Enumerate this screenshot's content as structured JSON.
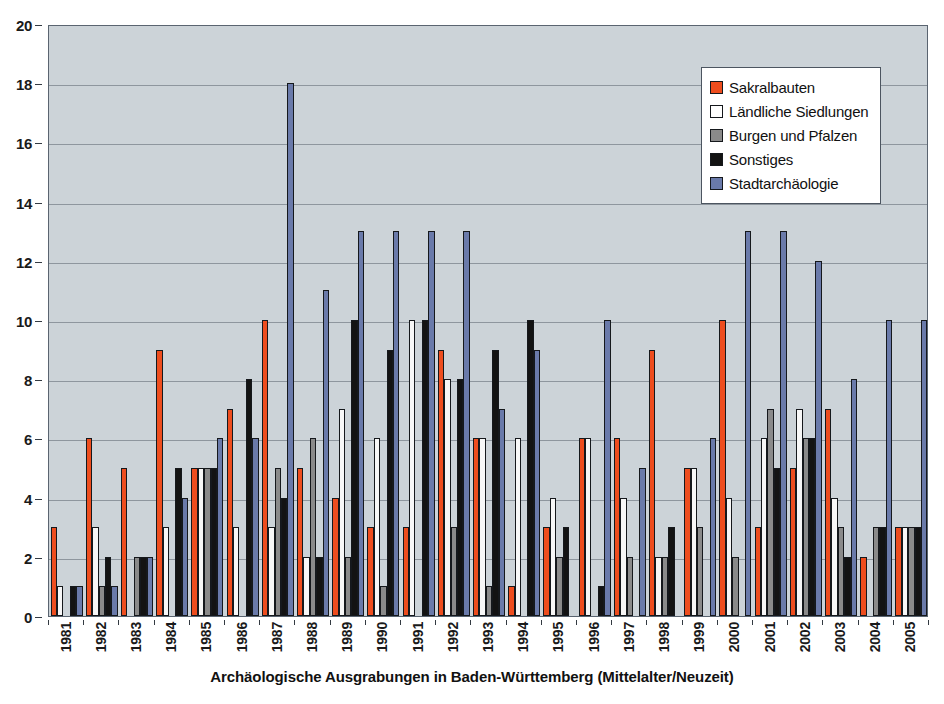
{
  "chart_data": {
    "type": "bar",
    "title": "Archäologische Ausgrabungen in Baden-Württemberg (Mittelalter/Neuzeit)",
    "xlabel": "Archäologische Ausgrabungen in Baden-Württemberg (Mittelalter/Neuzeit)",
    "ylabel": "",
    "ylim": [
      0,
      20
    ],
    "ytick_step": 2,
    "yticks": [
      0,
      2,
      4,
      6,
      8,
      10,
      12,
      14,
      16,
      18,
      20
    ],
    "grid": true,
    "legend_position": "top-right",
    "categories": [
      "1981",
      "1982",
      "1983",
      "1984",
      "1985",
      "1986",
      "1987",
      "1988",
      "1989",
      "1990",
      "1991",
      "1992",
      "1993",
      "1994",
      "1995",
      "1996",
      "1997",
      "1998",
      "1999",
      "2000",
      "2001",
      "2002",
      "2003",
      "2004",
      "2005"
    ],
    "series": [
      {
        "name": "Sakralbauten",
        "color": "#ee4d1e",
        "values": [
          3,
          6,
          5,
          9,
          5,
          7,
          10,
          5,
          4,
          3,
          3,
          9,
          6,
          1,
          3,
          6,
          6,
          9,
          5,
          10,
          3,
          5,
          7,
          2,
          3
        ]
      },
      {
        "name": "Ländliche Siedlungen",
        "color": "#f7f7f7",
        "values": [
          1,
          3,
          0,
          3,
          5,
          3,
          3,
          2,
          7,
          6,
          10,
          8,
          6,
          6,
          4,
          6,
          4,
          2,
          5,
          4,
          6,
          7,
          4,
          0,
          3
        ]
      },
      {
        "name": "Burgen und Pfalzen",
        "color": "#8a8a8a",
        "values": [
          0,
          1,
          2,
          0,
          5,
          0,
          5,
          6,
          2,
          1,
          0,
          3,
          1,
          0,
          2,
          0,
          2,
          2,
          3,
          2,
          7,
          6,
          3,
          3,
          3
        ]
      },
      {
        "name": "Sonstiges",
        "color": "#131313",
        "values": [
          1,
          2,
          2,
          5,
          5,
          8,
          4,
          2,
          10,
          9,
          10,
          8,
          9,
          10,
          3,
          1,
          0,
          3,
          0,
          0,
          5,
          6,
          2,
          3,
          3
        ]
      },
      {
        "name": "Stadtarchäologie",
        "color": "#6a7aaa",
        "values": [
          1,
          1,
          2,
          4,
          6,
          6,
          18,
          11,
          13,
          13,
          13,
          13,
          7,
          9,
          0,
          10,
          5,
          0,
          6,
          13,
          13,
          12,
          8,
          10,
          10
        ]
      }
    ]
  },
  "legend": {
    "items": [
      {
        "label": "Sakralbauten",
        "swatch": "legend-swatch-sakralbauten"
      },
      {
        "label": "Ländliche Siedlungen",
        "swatch": "legend-swatch-laendliche-siedlungen"
      },
      {
        "label": "Burgen und Pfalzen",
        "swatch": "legend-swatch-burgen-und-pfalzen"
      },
      {
        "label": "Sonstiges",
        "swatch": "legend-swatch-sonstiges"
      },
      {
        "label": "Stadtarchäologie",
        "swatch": "legend-swatch-stadtarchaeologie"
      }
    ]
  },
  "colors": {
    "plot_background": "#ccd3d8",
    "page_background": "#ffffff",
    "gridline": "#8e969e",
    "axis": "#333a42",
    "bar_outline": "#15181c"
  }
}
